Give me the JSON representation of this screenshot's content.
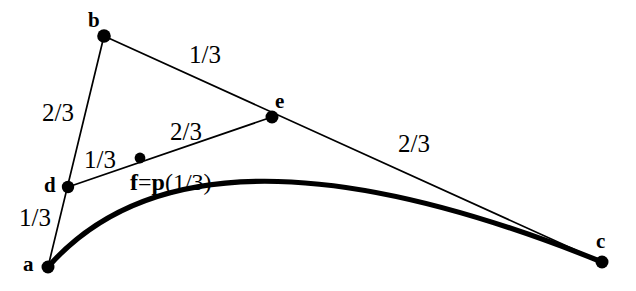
{
  "figure": {
    "background_color": "#ffffff",
    "stroke_color": "#000000",
    "width": 636,
    "height": 291,
    "thin_line_width": 1.6,
    "thick_curve_width": 5.0,
    "point_radius": 6.5
  },
  "points": [
    {
      "id": "a",
      "label": "a",
      "x": 48,
      "y": 267,
      "label_x": 23,
      "label_y": 254
    },
    {
      "id": "b",
      "label": "b",
      "x": 104,
      "y": 36,
      "label_x": 88,
      "label_y": 10
    },
    {
      "id": "c",
      "label": "c",
      "x": 602,
      "y": 262,
      "label_x": 596,
      "label_y": 231
    },
    {
      "id": "d",
      "label": "d",
      "x": 68,
      "y": 187,
      "label_x": 44,
      "label_y": 175
    },
    {
      "id": "e",
      "label": "e",
      "x": 272,
      "y": 117,
      "label_x": 275,
      "label_y": 91
    },
    {
      "id": "f",
      "label": "f=p(1/3)",
      "x": 140,
      "y": 158,
      "label_x": 130,
      "label_y": 170
    }
  ],
  "control_polygon_segments": [
    {
      "from": "a",
      "to": "b"
    },
    {
      "from": "b",
      "to": "c"
    },
    {
      "from": "d",
      "to": "e"
    }
  ],
  "ratio_labels": [
    {
      "id": "ab-upper",
      "text": "2/3",
      "x": 42,
      "y": 100,
      "segment": "a-b upper portion"
    },
    {
      "id": "ab-lower",
      "text": "1/3",
      "x": 19,
      "y": 205,
      "segment": "a-b lower portion"
    },
    {
      "id": "bc-left",
      "text": "1/3",
      "x": 189,
      "y": 42,
      "segment": "b-c left portion"
    },
    {
      "id": "bc-right",
      "text": "2/3",
      "x": 398,
      "y": 131,
      "segment": "b-c right portion"
    },
    {
      "id": "de-left",
      "text": "1/3",
      "x": 84,
      "y": 147,
      "segment": "d-e left portion"
    },
    {
      "id": "de-right",
      "text": "2/3",
      "x": 170,
      "y": 119,
      "segment": "d-e right portion"
    }
  ],
  "bezier_curve": {
    "description": "thick quadratic-like Bezier curve from a to c with control point b",
    "start": "a",
    "control": "b",
    "end": "c",
    "path": "M 48 267 Q 196 98 602 262"
  },
  "f_label_parts": {
    "bold": "f",
    "equals": "=",
    "bold_p": "p",
    "argument": "(1/3)"
  }
}
